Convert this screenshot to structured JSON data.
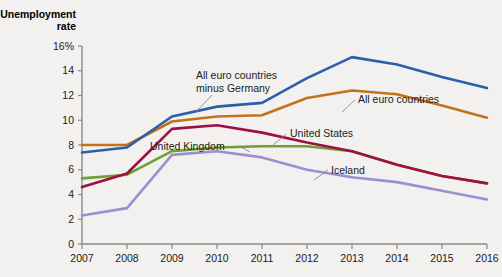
{
  "chart_data": {
    "type": "line",
    "title": "Unemployment rate",
    "title_line1": "Unemployment",
    "title_line2": "rate",
    "xlabel": "",
    "ylabel": "Unemployment rate",
    "x": [
      2007,
      2008,
      2009,
      2010,
      2011,
      2012,
      2013,
      2014,
      2015,
      2016
    ],
    "xtick_labels": [
      "2007",
      "2008",
      "2009",
      "2010",
      "2011",
      "2012",
      "2013",
      "2014",
      "2015",
      "2016"
    ],
    "ytick_labels": [
      "0",
      "2",
      "4",
      "6",
      "8",
      "10",
      "12",
      "14",
      "16%"
    ],
    "ytick_values": [
      0,
      2,
      4,
      6,
      8,
      10,
      12,
      14,
      16
    ],
    "ylim": [
      0,
      16
    ],
    "xlim": [
      2007,
      2016
    ],
    "grid": false,
    "legend_position": "inline-annotations",
    "series": [
      {
        "name": "All euro countries minus Germany",
        "color": "#2d5fa8",
        "values": [
          7.4,
          7.8,
          10.3,
          11.1,
          11.4,
          13.4,
          15.1,
          14.5,
          13.5,
          12.6
        ]
      },
      {
        "name": "All euro countries",
        "color": "#c2721a",
        "values": [
          8.0,
          8.0,
          9.9,
          10.3,
          10.4,
          11.8,
          12.4,
          12.1,
          11.2,
          10.2
        ]
      },
      {
        "name": "United States",
        "color": "#9e1040",
        "values": [
          4.6,
          5.7,
          9.3,
          9.6,
          9.0,
          8.2,
          7.5,
          6.4,
          5.5,
          4.9
        ]
      },
      {
        "name": "United Kingdom",
        "color": "#6f9e33",
        "values": [
          5.3,
          5.6,
          7.5,
          7.8,
          7.9,
          7.9,
          7.5,
          6.4,
          5.5,
          4.9
        ]
      },
      {
        "name": "Iceland",
        "color": "#9a8fd0",
        "values": [
          2.3,
          2.9,
          7.2,
          7.5,
          7.0,
          6.0,
          5.4,
          5.0,
          4.3,
          3.6
        ]
      }
    ],
    "annotations": [
      {
        "text_line1": "All euro countries",
        "text_line2": "minus Germany",
        "series": "All euro countries minus Germany"
      },
      {
        "text_line1": "All euro countries",
        "text_line2": "",
        "series": "All euro countries"
      },
      {
        "text_line1": "United States",
        "text_line2": "",
        "series": "United States"
      },
      {
        "text_line1": "United Kingdom",
        "text_line2": "",
        "series": "United Kingdom"
      },
      {
        "text_line1": "Iceland",
        "text_line2": "",
        "series": "Iceland"
      }
    ]
  }
}
